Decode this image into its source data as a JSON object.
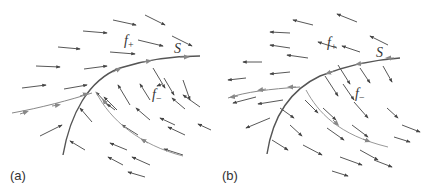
{
  "figure": {
    "colors": {
      "vector": "#444444",
      "surface": "#555555",
      "trajectory": "#999999",
      "text": "#333333"
    },
    "panels": [
      {
        "id": "a",
        "label": "(a)",
        "surface_label": "S",
        "f_plus": {
          "base": "f",
          "sub": "+"
        },
        "f_minus": {
          "base": "f",
          "sub": "−"
        },
        "description": "Vector field above S points toward S, field below S points toward S; trajectory slides along S"
      },
      {
        "id": "b",
        "label": "(b)",
        "surface_label": "S",
        "f_plus": {
          "base": "f",
          "sub": "+"
        },
        "f_minus": {
          "base": "f",
          "sub": "−"
        },
        "description": "Vector field above S points away (left), field below S points away (down-right); trajectories leave S"
      }
    ]
  }
}
